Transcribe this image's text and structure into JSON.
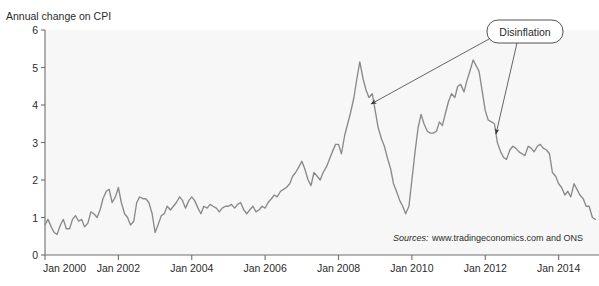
{
  "chart_data": {
    "type": "line",
    "title": "",
    "ylabel": "Annual change on CPI",
    "xlabel": "",
    "ylim": [
      0,
      6
    ],
    "yticks": [
      0,
      1,
      2,
      3,
      4,
      5,
      6
    ],
    "ytick_labels": [
      "0",
      "1",
      "2",
      "3",
      "4",
      "5",
      "6"
    ],
    "xtick_labels": [
      "Jan 2000",
      "Jan 2002",
      "Jan 2004",
      "Jan 2006",
      "Jan 2008",
      "Jan 2010",
      "Jan 2012",
      "Jan 2014"
    ],
    "xtick_values": [
      2000.0,
      2002.0,
      2004.0,
      2006.0,
      2008.0,
      2010.0,
      2012.0,
      2014.0
    ],
    "xlim": [
      2000.0,
      2015.1
    ],
    "grid": false,
    "legend": "none",
    "line_color": "#8a8a8a",
    "series": [
      {
        "name": "Annual change on CPI",
        "x": [
          2000.0,
          2000.08,
          2000.17,
          2000.25,
          2000.33,
          2000.42,
          2000.5,
          2000.58,
          2000.67,
          2000.75,
          2000.83,
          2000.92,
          2001.0,
          2001.08,
          2001.17,
          2001.25,
          2001.33,
          2001.42,
          2001.5,
          2001.58,
          2001.67,
          2001.75,
          2001.83,
          2001.92,
          2002.0,
          2002.08,
          2002.17,
          2002.25,
          2002.33,
          2002.42,
          2002.5,
          2002.58,
          2002.67,
          2002.75,
          2002.83,
          2002.92,
          2003.0,
          2003.08,
          2003.17,
          2003.25,
          2003.33,
          2003.42,
          2003.5,
          2003.58,
          2003.67,
          2003.75,
          2003.83,
          2003.92,
          2004.0,
          2004.08,
          2004.17,
          2004.25,
          2004.33,
          2004.42,
          2004.5,
          2004.58,
          2004.67,
          2004.75,
          2004.83,
          2004.92,
          2005.0,
          2005.08,
          2005.17,
          2005.25,
          2005.33,
          2005.42,
          2005.5,
          2005.58,
          2005.67,
          2005.75,
          2005.83,
          2005.92,
          2006.0,
          2006.08,
          2006.17,
          2006.25,
          2006.33,
          2006.42,
          2006.5,
          2006.58,
          2006.67,
          2006.75,
          2006.83,
          2006.92,
          2007.0,
          2007.08,
          2007.17,
          2007.25,
          2007.33,
          2007.42,
          2007.5,
          2007.58,
          2007.67,
          2007.75,
          2007.83,
          2007.92,
          2008.0,
          2008.08,
          2008.17,
          2008.25,
          2008.33,
          2008.42,
          2008.5,
          2008.58,
          2008.67,
          2008.75,
          2008.83,
          2008.92,
          2009.0,
          2009.08,
          2009.17,
          2009.25,
          2009.33,
          2009.42,
          2009.5,
          2009.58,
          2009.67,
          2009.75,
          2009.83,
          2009.92,
          2010.0,
          2010.08,
          2010.17,
          2010.25,
          2010.33,
          2010.42,
          2010.5,
          2010.58,
          2010.67,
          2010.75,
          2010.83,
          2010.92,
          2011.0,
          2011.08,
          2011.17,
          2011.25,
          2011.33,
          2011.42,
          2011.5,
          2011.58,
          2011.67,
          2011.75,
          2011.83,
          2011.92,
          2012.0,
          2012.08,
          2012.17,
          2012.25,
          2012.33,
          2012.42,
          2012.5,
          2012.58,
          2012.67,
          2012.75,
          2012.83,
          2012.92,
          2013.0,
          2013.08,
          2013.17,
          2013.25,
          2013.33,
          2013.42,
          2013.5,
          2013.58,
          2013.67,
          2013.75,
          2013.83,
          2013.92,
          2014.0,
          2014.08,
          2014.17,
          2014.25,
          2014.33,
          2014.42,
          2014.5,
          2014.58,
          2014.67,
          2014.75,
          2014.83,
          2014.92,
          2015.0
        ],
        "values": [
          0.8,
          0.95,
          0.75,
          0.6,
          0.55,
          0.8,
          0.95,
          0.7,
          0.7,
          0.95,
          1.05,
          0.9,
          0.95,
          0.75,
          0.85,
          1.15,
          1.1,
          1.0,
          1.2,
          1.5,
          1.7,
          1.75,
          1.4,
          1.55,
          1.8,
          1.4,
          1.1,
          1.0,
          0.8,
          0.9,
          1.4,
          1.55,
          1.5,
          1.5,
          1.4,
          1.1,
          0.6,
          0.8,
          1.05,
          1.1,
          1.3,
          1.2,
          1.3,
          1.4,
          1.55,
          1.45,
          1.25,
          1.45,
          1.55,
          1.45,
          1.25,
          1.1,
          1.3,
          1.25,
          1.35,
          1.3,
          1.25,
          1.15,
          1.25,
          1.3,
          1.3,
          1.35,
          1.25,
          1.35,
          1.4,
          1.2,
          1.1,
          1.2,
          1.3,
          1.15,
          1.2,
          1.3,
          1.25,
          1.4,
          1.5,
          1.6,
          1.55,
          1.7,
          1.75,
          1.8,
          1.9,
          2.1,
          2.2,
          2.35,
          2.5,
          2.3,
          2.0,
          1.85,
          2.2,
          2.1,
          2.0,
          2.2,
          2.35,
          2.55,
          2.75,
          2.95,
          2.95,
          2.7,
          3.2,
          3.5,
          3.8,
          4.2,
          4.7,
          5.15,
          4.7,
          4.4,
          4.2,
          4.3,
          3.85,
          3.4,
          3.1,
          2.9,
          2.6,
          2.3,
          1.9,
          1.7,
          1.45,
          1.3,
          1.1,
          1.3,
          2.0,
          2.7,
          3.4,
          3.75,
          3.5,
          3.3,
          3.25,
          3.25,
          3.3,
          3.55,
          3.45,
          3.8,
          4.1,
          4.3,
          4.2,
          4.5,
          4.55,
          4.35,
          4.65,
          4.9,
          5.2,
          5.05,
          4.9,
          4.35,
          3.85,
          3.6,
          3.55,
          3.5,
          3.0,
          2.75,
          2.6,
          2.55,
          2.8,
          2.9,
          2.85,
          2.75,
          2.7,
          2.65,
          2.9,
          2.85,
          2.75,
          2.9,
          2.95,
          2.85,
          2.8,
          2.7,
          2.2,
          2.1,
          1.9,
          1.8,
          1.6,
          1.7,
          1.55,
          1.9,
          1.75,
          1.6,
          1.5,
          1.3,
          1.3,
          1.0,
          0.95
        ]
      }
    ],
    "annotations": [
      {
        "label": "Disinflation",
        "box_x": 487,
        "box_y": 20,
        "box_w": 76,
        "box_h": 23,
        "arrows": [
          {
            "from_x": 489,
            "from_y": 39,
            "to_x": 371,
            "to_y": 104
          },
          {
            "from_x": 517,
            "from_y": 43,
            "to_x": 496,
            "to_y": 134
          }
        ]
      }
    ],
    "source_prefix": "Sources:",
    "source_text": "www.tradingeconomics.com and ONS"
  },
  "figure": {
    "background_color": "#ffffff",
    "plot_background_color": "#f7f7f7",
    "axis_color": "#6e6e6e",
    "text_color": "#2b2b2b"
  }
}
